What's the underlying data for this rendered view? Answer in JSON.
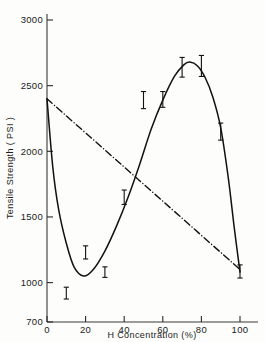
{
  "chart_data": {
    "type": "line",
    "title": "",
    "xlabel": "H  Concentration (%)",
    "ylabel": "Tensile Strength ( PSI )",
    "xlim": [
      0,
      100
    ],
    "ylim": [
      700,
      3000
    ],
    "grid": false,
    "legend": "none",
    "xticks": [
      0,
      20,
      40,
      60,
      80,
      100
    ],
    "xtick_labels": [
      "0",
      "20",
      "40",
      "60",
      "80",
      "100"
    ],
    "yticks": [
      700,
      1000,
      1500,
      2000,
      2500,
      3000
    ],
    "ytick_labels": [
      "700",
      "1000",
      "1500",
      "2000",
      "2500",
      "3000"
    ],
    "series": [
      {
        "name": "solid-curve",
        "style": "solid",
        "x": [
          0,
          3,
          6,
          10,
          14,
          19,
          24,
          30,
          36,
          42,
          48,
          54,
          60,
          66,
          71,
          74,
          78,
          82,
          86,
          90,
          94,
          97,
          100
        ],
        "values": [
          2400,
          1880,
          1560,
          1300,
          1120,
          1050,
          1100,
          1240,
          1430,
          1650,
          1900,
          2170,
          2390,
          2570,
          2660,
          2680,
          2650,
          2560,
          2410,
          2180,
          1790,
          1420,
          1080
        ]
      },
      {
        "name": "dash-dot-line",
        "style": "dashdot",
        "x": [
          0,
          100
        ],
        "values": [
          2400,
          1100
        ]
      }
    ],
    "error_bars": [
      {
        "x": 10,
        "y": 920,
        "err_low": 45,
        "err_high": 45
      },
      {
        "x": 20,
        "y": 1230,
        "err_low": 50,
        "err_high": 50
      },
      {
        "x": 30,
        "y": 1080,
        "err_low": 40,
        "err_high": 40
      },
      {
        "x": 40,
        "y": 1650,
        "err_low": 55,
        "err_high": 55
      },
      {
        "x": 50,
        "y": 2390,
        "err_low": 65,
        "err_high": 65
      },
      {
        "x": 60,
        "y": 2395,
        "err_low": 60,
        "err_high": 60
      },
      {
        "x": 70,
        "y": 2640,
        "err_low": 75,
        "err_high": 75
      },
      {
        "x": 80,
        "y": 2650,
        "err_low": 80,
        "err_high": 80
      },
      {
        "x": 90,
        "y": 2150,
        "err_low": 65,
        "err_high": 65
      },
      {
        "x": 100,
        "y": 1085,
        "err_low": 50,
        "err_high": 50
      }
    ]
  },
  "colors": {
    "background": "#fdfdfb",
    "ink": "#111111",
    "axis": "#3a3a3a"
  }
}
